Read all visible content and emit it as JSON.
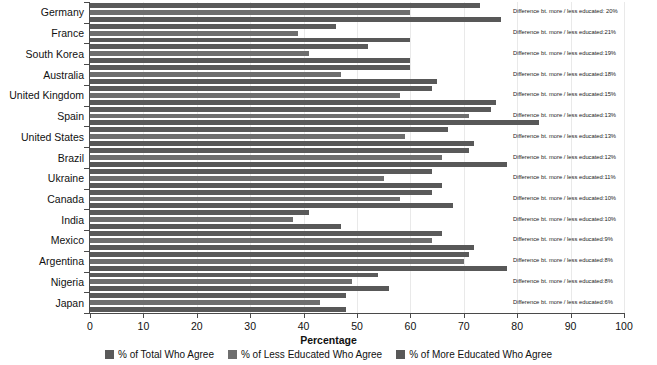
{
  "chart_data": {
    "type": "bar",
    "orientation": "horizontal",
    "title": "",
    "xlabel": "Percentage",
    "ylabel": "",
    "xlim": [
      0,
      100
    ],
    "xticks": [
      0,
      10,
      20,
      30,
      40,
      50,
      60,
      70,
      80,
      90,
      100
    ],
    "grid": true,
    "legend_position": "bottom",
    "categories": [
      "Germany",
      "France",
      "South Korea",
      "Australia",
      "United Kingdom",
      "Spain",
      "United States",
      "Brazil",
      "Ukraine",
      "Canada",
      "India",
      "Mexico",
      "Argentina",
      "Nigeria",
      "Japan"
    ],
    "series": [
      {
        "name": "% of Total Who Agree",
        "color": "#5a5a5a",
        "values": [
          73,
          46,
          52,
          60,
          64,
          75,
          67,
          71,
          64,
          64,
          41,
          66,
          71,
          54,
          48
        ]
      },
      {
        "name": "% of Less Educated Who Agree",
        "color": "#6e6e6e",
        "values": [
          60,
          39,
          41,
          47,
          58,
          71,
          59,
          66,
          55,
          58,
          38,
          64,
          70,
          49,
          43
        ]
      },
      {
        "name": "% of More Educated Who Agree",
        "color": "#585858",
        "values": [
          77,
          60,
          60,
          65,
          76,
          84,
          72,
          78,
          66,
          68,
          47,
          72,
          78,
          56,
          48
        ]
      }
    ],
    "annotations": [
      "Difference bt. more / less educated: 20%",
      "Difference bt. more / less educated:21%",
      "Difference bt. more / less educated:19%",
      "Difference bt. more / less educated:18%",
      "Difference bt. more / less educated:15%",
      "Difference bt. more / less educated:13%",
      "Difference bt. more / less educated:13%",
      "Difference bt. more / less educated:12%",
      "Difference bt. more / less educated:11%",
      "Difference bt. more / less educated:10%",
      "Difference bt. more / less educated:10%",
      "Difference bt. more / less educated:9%",
      "Difference bt. more / less educated:8%",
      "Difference bt. more / less educated:8%",
      "Difference bt. more / less educated:6%"
    ]
  },
  "legend": {
    "items": [
      {
        "label": "% of Total Who Agree",
        "color": "#5a5a5a"
      },
      {
        "label": "% of Less Educated Who Agree",
        "color": "#6e6e6e"
      },
      {
        "label": "% of More Educated Who Agree",
        "color": "#585858"
      }
    ]
  },
  "axis": {
    "x_title": "Percentage"
  },
  "colors": {
    "axis": "#4a4a4a",
    "grid": "#e9e9e9",
    "text": "#111111",
    "background": "#ffffff"
  }
}
